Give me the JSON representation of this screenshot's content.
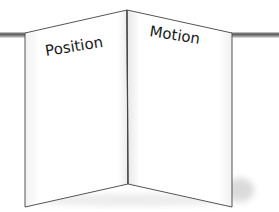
{
  "diagram": {
    "type": "folded-booklet",
    "panels": [
      {
        "label": "Position"
      },
      {
        "label": "Motion"
      }
    ],
    "colors": {
      "background": "#ffffff",
      "panel_fill": "#ffffff",
      "panel_stroke": "#555555",
      "line": "#7a7a7a",
      "text": "#1a1a1a"
    }
  }
}
